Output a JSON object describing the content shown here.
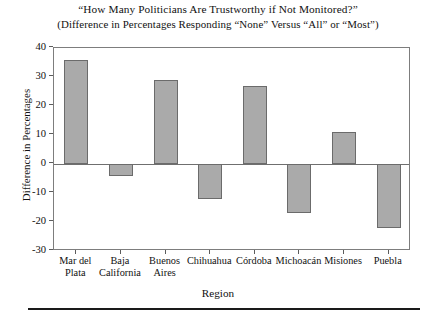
{
  "figure": {
    "title_line1": "“How Many Politicians Are Trustworthy if Not Monitored?”",
    "title_line2": "(Difference in Percentages Responding “None” Versus “All” or “Most”)"
  },
  "axes": {
    "xlabel": "Region",
    "ylabel": "Difference in Percentages"
  },
  "style": {
    "bar_fill": "#aaaaaa",
    "bar_stroke": "#6b6b6b",
    "frame_stroke": "#7d7d7d",
    "text_color": "#111111"
  },
  "chart_data": {
    "type": "bar",
    "title": "“How Many Politicians Are Trustworthy if Not Monitored?” (Difference in Percentages Responding “None” Versus “All” or “Most”)",
    "xlabel": "Region",
    "ylabel": "Difference in Percentages",
    "categories": [
      "Mar del Plata",
      "Baja California",
      "Buenos Aires",
      "Chihuahua",
      "Córdoba",
      "Michoacán",
      "Misiones",
      "Puebla"
    ],
    "category_lines": [
      [
        "Mar del",
        "Plata"
      ],
      [
        "Baja",
        "California"
      ],
      [
        "Buenos",
        "Aires"
      ],
      [
        "Chihuahua"
      ],
      [
        "Córdoba"
      ],
      [
        "Michoacán"
      ],
      [
        "Misiones"
      ],
      [
        "Puebla"
      ]
    ],
    "values": [
      36,
      -4,
      29,
      -12,
      27,
      -17,
      11,
      -22
    ],
    "ylim": [
      -30,
      40
    ],
    "yticks": [
      40,
      30,
      20,
      10,
      0,
      -10,
      -20,
      -30
    ],
    "ytick_labels": [
      "40",
      "30",
      "20",
      "10",
      "0",
      "-10",
      "-20",
      "-30"
    ],
    "grid": false,
    "legend": null
  }
}
